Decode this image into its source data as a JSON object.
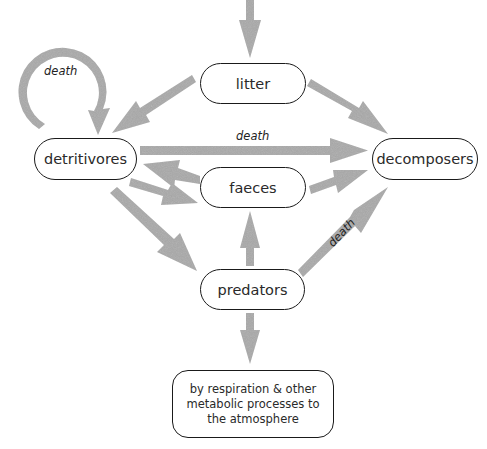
{
  "diagram": {
    "type": "flow diagram",
    "nodes": {
      "litter": "litter",
      "detritivores": "detritivores",
      "faeces": "faeces",
      "decomposers": "decomposers",
      "predators": "predators",
      "atmosphere": "by respiration & other metabolic processes to the atmosphere"
    },
    "edge_labels": {
      "self_loop": "death",
      "detritivores_to_decomposers": "death",
      "predators_to_decomposers": "death"
    },
    "edges": [
      {
        "from": "(input)",
        "to": "litter"
      },
      {
        "from": "litter",
        "to": "detritivores"
      },
      {
        "from": "litter",
        "to": "decomposers"
      },
      {
        "from": "detritivores",
        "to": "detritivores",
        "label": "death"
      },
      {
        "from": "detritivores",
        "to": "decomposers",
        "label": "death"
      },
      {
        "from": "faeces",
        "to": "detritivores"
      },
      {
        "from": "detritivores",
        "to": "faeces"
      },
      {
        "from": "faeces",
        "to": "decomposers"
      },
      {
        "from": "detritivores",
        "to": "predators"
      },
      {
        "from": "predators",
        "to": "faeces"
      },
      {
        "from": "predators",
        "to": "decomposers",
        "label": "death"
      },
      {
        "from": "predators",
        "to": "atmosphere"
      }
    ],
    "colors": {
      "arrow": "#a9a9a9",
      "node_border": "#1a1a1a",
      "text": "#2a2a2a"
    }
  }
}
